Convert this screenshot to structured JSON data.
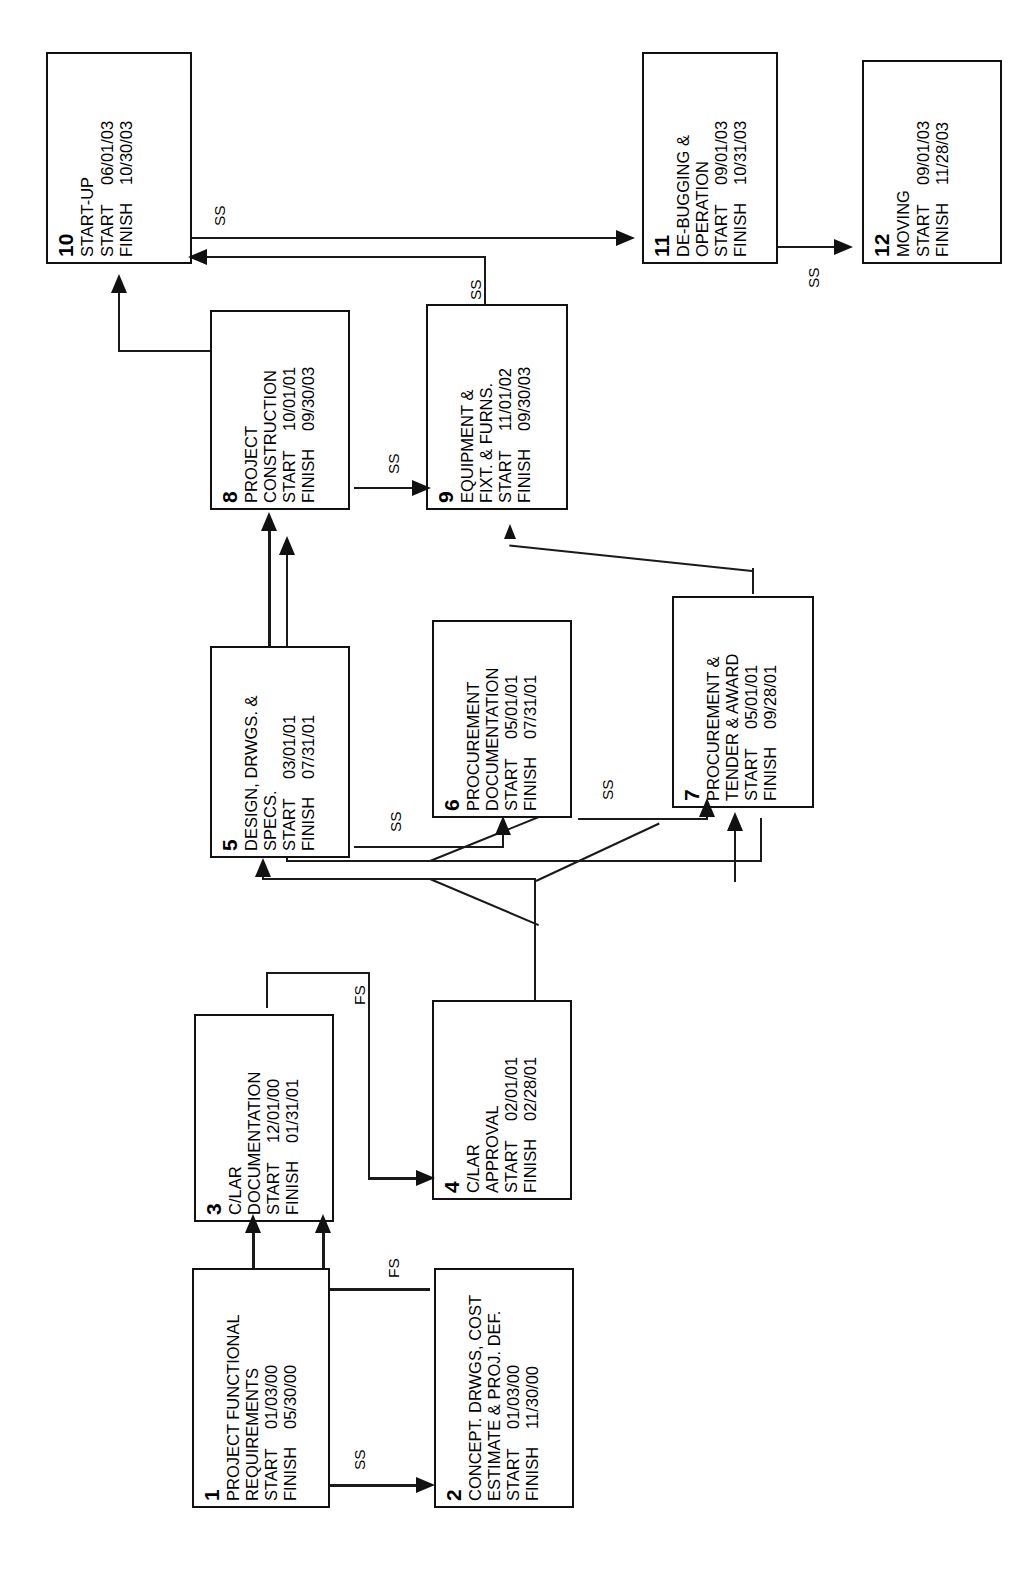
{
  "diagram": {
    "type": "precedence-network-diagram",
    "orientation": "text-rotated-90-ccw",
    "labels": {
      "start": "START",
      "finish": "FINISH"
    },
    "nodes": [
      {
        "id": "1",
        "title": "PROJECT FUNCTIONAL\nREQUIREMENTS",
        "start": "01/03/00",
        "finish": "05/30/00"
      },
      {
        "id": "2",
        "title": "CONCEPT. DRWGS, COST\nESTIMATE & PROJ. DEF.",
        "start": "01/03/00",
        "finish": "11/30/00"
      },
      {
        "id": "3",
        "title": "C/LAR\nDOCUMENTATION",
        "start": "12/01/00",
        "finish": "01/31/01"
      },
      {
        "id": "4",
        "title": "C/LAR\nAPPROVAL",
        "start": "02/01/01",
        "finish": "02/28/01"
      },
      {
        "id": "5",
        "title": "DESIGN, DRWGS. &\nSPECS.",
        "start": "03/01/01",
        "finish": "07/31/01"
      },
      {
        "id": "6",
        "title": "PROCUREMENT\nDOCUMENTATION",
        "start": "05/01/01",
        "finish": "07/31/01"
      },
      {
        "id": "7",
        "title": "PROCUREMENT &\nTENDER & AWARD",
        "start": "05/01/01",
        "finish": "09/28/01"
      },
      {
        "id": "8",
        "title": "PROJECT\nCONSTRUCTION",
        "start": "10/01/01",
        "finish": "09/30/03"
      },
      {
        "id": "9",
        "title": "EQUIPMENT &\nFIXT. & FURNS.",
        "start": "11/01/02",
        "finish": "09/30/03"
      },
      {
        "id": "10",
        "title": "START-UP",
        "start": "06/01/03",
        "finish": "10/30/03"
      },
      {
        "id": "11",
        "title": "DE-BUGGING &\nOPERATION",
        "start": "09/01/03",
        "finish": "10/31/03"
      },
      {
        "id": "12",
        "title": "MOVING",
        "start": "09/01/03",
        "finish": "11/28/03"
      }
    ],
    "edges": [
      {
        "from": "1",
        "to": "2",
        "relation": "SS"
      },
      {
        "from": "1",
        "to": "3",
        "relation": ""
      },
      {
        "from": "2",
        "to": "3",
        "relation": "FS"
      },
      {
        "from": "2",
        "to": "4",
        "relation": "FS"
      },
      {
        "from": "3",
        "to": "4",
        "relation": "FS"
      },
      {
        "from": "4",
        "to": "5",
        "relation": ""
      },
      {
        "from": "4",
        "to": "7",
        "relation": ""
      },
      {
        "from": "5",
        "to": "6",
        "relation": "SS"
      },
      {
        "from": "5",
        "to": "8",
        "relation": ""
      },
      {
        "from": "6",
        "to": "7",
        "relation": "SS"
      },
      {
        "from": "7",
        "to": "8",
        "relation": ""
      },
      {
        "from": "7",
        "to": "9",
        "relation": ""
      },
      {
        "from": "8",
        "to": "9",
        "relation": "SS"
      },
      {
        "from": "8",
        "to": "10",
        "relation": ""
      },
      {
        "from": "9",
        "to": "10",
        "relation": "SS"
      },
      {
        "from": "10",
        "to": "11",
        "relation": "SS"
      },
      {
        "from": "11",
        "to": "12",
        "relation": "SS"
      }
    ],
    "edge_labels": [
      {
        "name": "ss-1-2",
        "text": "SS"
      },
      {
        "name": "fs-2-3",
        "text": "FS"
      },
      {
        "name": "fs-3-4",
        "text": "FS"
      },
      {
        "name": "ss-5-6",
        "text": "SS"
      },
      {
        "name": "ss-6-7",
        "text": "SS"
      },
      {
        "name": "ss-8-9",
        "text": "SS"
      },
      {
        "name": "ss-9-10",
        "text": "SS"
      },
      {
        "name": "ss-10-11",
        "text": "SS"
      },
      {
        "name": "ss-11-12",
        "text": "SS"
      }
    ]
  }
}
